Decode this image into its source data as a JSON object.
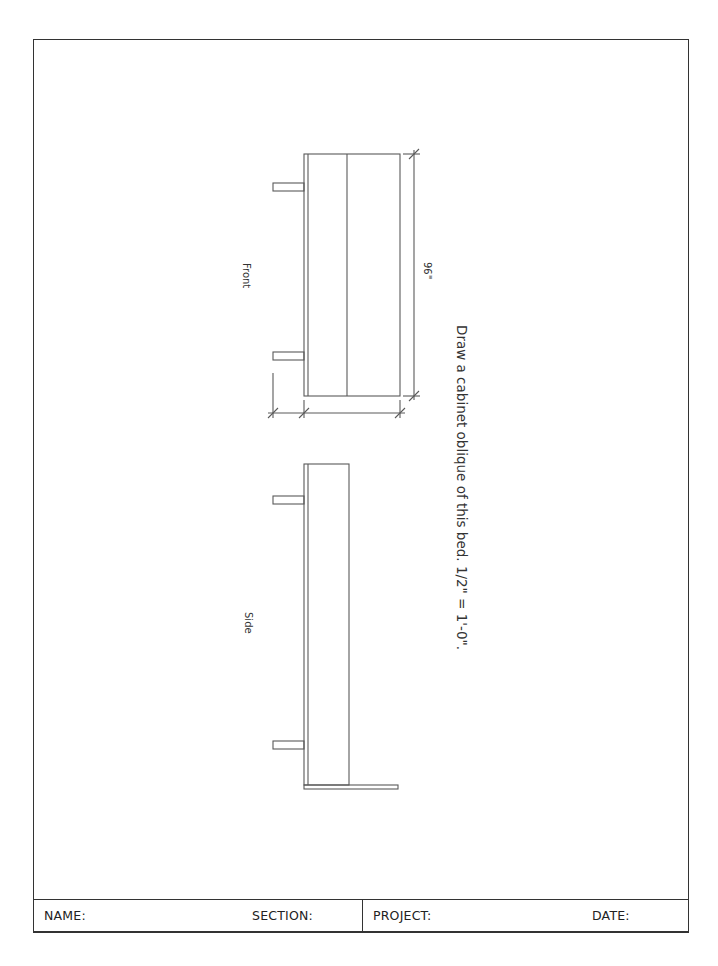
{
  "instruction": "Draw a cabinet oblique of this bed. 1/2\" = 1'-0\".",
  "views": {
    "front": {
      "label": "Front",
      "dimension": "96\""
    },
    "side": {
      "label": "Side"
    }
  },
  "title_block": {
    "name_label": "NAME:",
    "section_label": "SECTION:",
    "project_label": "PROJECT:",
    "date_label": "DATE:"
  },
  "colors": {
    "line": "#555555",
    "border": "#333333",
    "text": "#333333"
  }
}
